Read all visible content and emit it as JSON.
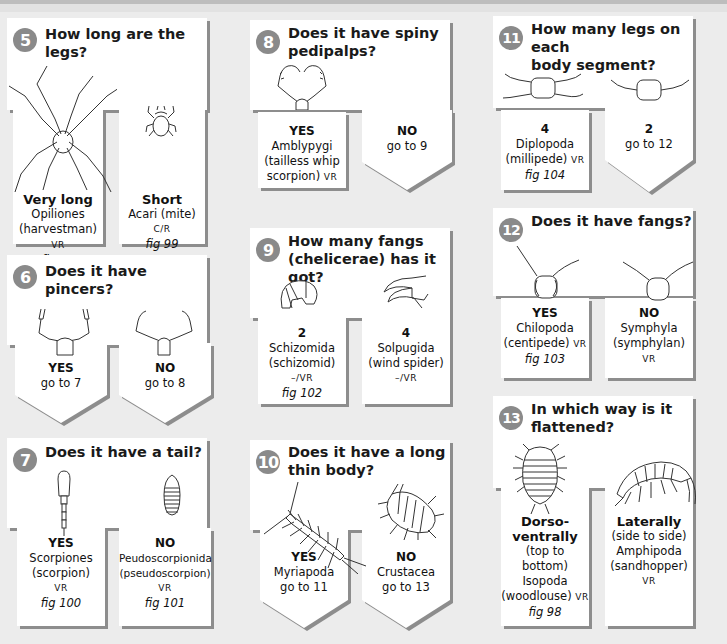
{
  "page": {
    "background": "#ececec",
    "panel_color": "#ffffff",
    "shadow_color": "#8d8d8d",
    "badge_color": "#8a8a8a"
  },
  "questions": [
    {
      "number": "5",
      "question": "How long are the legs?",
      "answers": [
        {
          "label": "Very long",
          "taxon": "Opiliones",
          "common": "(harvestman)",
          "status": "VR",
          "fig": "fig 97",
          "illustration": "harvestman-illustration"
        },
        {
          "label": "Short",
          "taxon": "Acari (mite)",
          "status": "C/R",
          "fig": "fig 99",
          "illustration": "mite-illustration"
        }
      ]
    },
    {
      "number": "6",
      "question": "Does it have pincers?",
      "answers": [
        {
          "label": "YES",
          "goto": "go to 7",
          "illustration": "pincers-illustration"
        },
        {
          "label": "NO",
          "goto": "go to 8",
          "illustration": "no-pincers-illustration"
        }
      ]
    },
    {
      "number": "7",
      "question": "Does it have a tail?",
      "answers": [
        {
          "label": "YES",
          "taxon": "Scorpiones",
          "common": "(scorpion)",
          "status": "VR",
          "fig": "fig 100",
          "illustration": "scorpion-tail-illustration"
        },
        {
          "label": "NO",
          "taxon": "Peudoscorpionida",
          "common": "(pseudoscorpion)",
          "status": "VR",
          "fig": "fig 101",
          "illustration": "pseudoscorpion-abdomen-illustration"
        }
      ]
    },
    {
      "number": "8",
      "question_line1": "Does it have spiny",
      "question_line2": "pedipalps?",
      "answers": [
        {
          "label": "YES",
          "taxon": "Amblypygi",
          "common_line1": "(tailless whip",
          "common_line2": "scorpion)",
          "status": "VR",
          "illustration": "spiny-pedipalps-illustration"
        },
        {
          "label": "NO",
          "goto": "go to 9"
        }
      ]
    },
    {
      "number": "9",
      "question_line1": "How many fangs",
      "question_line2": "(chelicerae) has it got?",
      "answers": [
        {
          "label": "2",
          "taxon": "Schizomida",
          "common": "(schizomid)",
          "status": "–/VR",
          "fig": "fig 102",
          "illustration": "two-fangs-illustration"
        },
        {
          "label": "4",
          "taxon": "Solpugida",
          "common": "(wind spider)",
          "status": "–/VR",
          "illustration": "four-fangs-illustration"
        }
      ]
    },
    {
      "number": "10",
      "question_line1": "Does it have a long",
      "question_line2": "thin body?",
      "answers": [
        {
          "label": "YES",
          "taxon": "Myriapoda",
          "goto": "go to 11",
          "illustration": "centipede-illustration"
        },
        {
          "label": "NO",
          "taxon": "Crustacea",
          "goto": "go to 13",
          "illustration": "woodlouse-illustration"
        }
      ]
    },
    {
      "number": "11",
      "question_line1": "How many legs on each",
      "question_line2": "body segment?",
      "answers": [
        {
          "label": "4",
          "taxon": "Diplopoda",
          "common": "(millipede)",
          "status": "VR",
          "fig": "fig 104",
          "illustration": "four-legs-segment-illustration"
        },
        {
          "label": "2",
          "goto": "go to 12",
          "illustration": "two-legs-segment-illustration"
        }
      ]
    },
    {
      "number": "12",
      "question": "Does it have fangs?",
      "answers": [
        {
          "label": "YES",
          "taxon": "Chilopoda",
          "common": "(centipede)",
          "status": "VR",
          "fig": "fig 103",
          "illustration": "centipede-head-illustration"
        },
        {
          "label": "NO",
          "taxon": "Symphyla",
          "common": "(symphylan)",
          "status": "VR",
          "illustration": "symphylan-head-illustration"
        }
      ]
    },
    {
      "number": "13",
      "question_line1": "In which way is it",
      "question_line2": "flattened?",
      "answers": [
        {
          "label_line1": "Dorso-",
          "label_line2": "ventrally",
          "detail_line1": "(top to",
          "detail_line2": "bottom)",
          "taxon": "Isopoda",
          "common": "(woodlouse)",
          "status": "VR",
          "fig": "fig 98",
          "illustration": "isopoda-illustration"
        },
        {
          "label": "Laterally",
          "detail": "(side to side)",
          "taxon": "Amphipoda",
          "common": "(sandhopper)",
          "status": "VR",
          "illustration": "amphipod-illustration"
        }
      ]
    }
  ]
}
